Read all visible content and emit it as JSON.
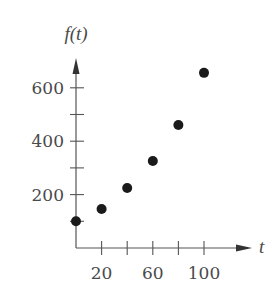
{
  "chart_data": {
    "type": "scatter",
    "title": "",
    "xlabel": "t",
    "ylabel": "f(t)",
    "x": [
      0,
      20,
      40,
      60,
      80,
      100
    ],
    "values": [
      100,
      146,
      225,
      326,
      461,
      656
    ],
    "xlim": [
      0,
      130
    ],
    "ylim": [
      0,
      700
    ],
    "x_ticks": [
      20,
      40,
      60,
      80,
      100
    ],
    "x_tick_labels": [
      "20",
      "60",
      "100"
    ],
    "x_tick_label_values": [
      20,
      60,
      100
    ],
    "y_ticks": [
      100,
      200,
      300,
      400,
      500,
      600
    ],
    "y_tick_labels": [
      "200",
      "400",
      "600"
    ],
    "y_tick_label_values": [
      200,
      400,
      600
    ],
    "grid": false,
    "legend": null,
    "marker_color": "#1a1a1a",
    "axis_color": "#555555"
  }
}
